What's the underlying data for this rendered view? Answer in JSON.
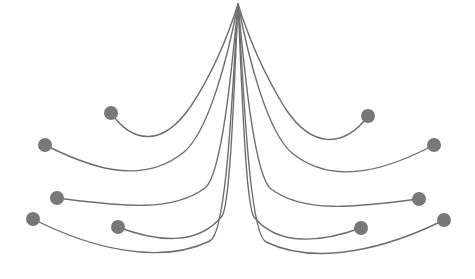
{
  "figure": {
    "name": "edge-bundling-diagram",
    "type": "hierarchical-edge-bundling",
    "width": 475,
    "height": 279,
    "background_color": "#ffffff",
    "edge_color": "#6e6e6e",
    "edge_width": 1.4,
    "node_color": "#787878",
    "node_radius": 7,
    "root": {
      "x": 238,
      "y": 4
    },
    "fade": {
      "enabled": true,
      "description": "edges fade to transparent white near the root convergence point",
      "start_opacity": 0.0,
      "end_opacity": 1.0
    }
  },
  "chart_data": {
    "type": "line",
    "title": "",
    "subtitle": "",
    "xlabel": "",
    "ylabel": "",
    "grid": false,
    "legend": "none",
    "xlim": [
      0,
      475
    ],
    "ylim": [
      0,
      279
    ],
    "root_node": {
      "id": "root",
      "x": 238,
      "y": 4
    },
    "nodes": [
      {
        "id": "L1",
        "side": "left",
        "x": 111,
        "y": 113,
        "r": 7
      },
      {
        "id": "L2",
        "side": "left",
        "x": 45,
        "y": 145,
        "r": 7
      },
      {
        "id": "L3",
        "side": "left",
        "x": 57,
        "y": 198,
        "r": 7
      },
      {
        "id": "L4",
        "side": "left",
        "x": 33,
        "y": 219,
        "r": 7
      },
      {
        "id": "L5",
        "side": "left",
        "x": 118,
        "y": 227,
        "r": 7
      },
      {
        "id": "R1",
        "side": "right",
        "x": 368,
        "y": 116,
        "r": 7
      },
      {
        "id": "R2",
        "side": "right",
        "x": 434,
        "y": 145,
        "r": 7
      },
      {
        "id": "R3",
        "side": "right",
        "x": 419,
        "y": 199,
        "r": 7
      },
      {
        "id": "R4",
        "side": "right",
        "x": 444,
        "y": 220,
        "r": 7
      },
      {
        "id": "R5",
        "side": "right",
        "x": 361,
        "y": 228,
        "r": 7
      }
    ],
    "edges": [
      {
        "id": "edge-1",
        "from": "L1",
        "to": "R1",
        "depth": 1,
        "path": "M 111 113 C 133 144, 163 147, 191 106 C 212 74, 228 36, 238 4 C 248 36, 264 74, 285 108 C 312 149, 344 148, 368 116"
      },
      {
        "id": "edge-2",
        "from": "L2",
        "to": "R2",
        "depth": 2,
        "path": "M 45 145 C 85 165, 140 188, 184 152 C 209 131, 228 56, 238 4 C 248 56, 267 132, 292 153 C 336 189, 394 166, 434 145"
      },
      {
        "id": "edge-3",
        "from": "L3",
        "to": "R3",
        "depth": 3,
        "path": "M 57 198 C 115 205, 170 214, 205 188 C 222 175, 232 66, 238 4 C 244 66, 254 176, 271 189 C 306 215, 362 206, 419 199"
      },
      {
        "id": "edge-4",
        "from": "L4",
        "to": "R4",
        "depth": 4,
        "path": "M 33 219 C 88 247, 158 266, 210 241 C 228 232, 233 70, 238 4 C 243 70, 248 233, 266 242 C 318 267, 390 247, 444 220"
      },
      {
        "id": "edge-5",
        "from": "L5",
        "to": "R5",
        "depth": 5,
        "path": "M 118 227 C 157 242, 198 246, 222 216 C 231 204, 235 62, 238 4 C 241 62, 245 205, 254 217 C 278 247, 322 242, 361 228"
      }
    ],
    "crossings": [
      {
        "approx_x": 212,
        "approx_y": 194
      },
      {
        "approx_x": 265,
        "approx_y": 196
      },
      {
        "approx_x": 238,
        "approx_y": 172
      },
      {
        "approx_x": 212,
        "approx_y": 216
      },
      {
        "approx_x": 266,
        "approx_y": 217
      }
    ],
    "annotations": []
  }
}
